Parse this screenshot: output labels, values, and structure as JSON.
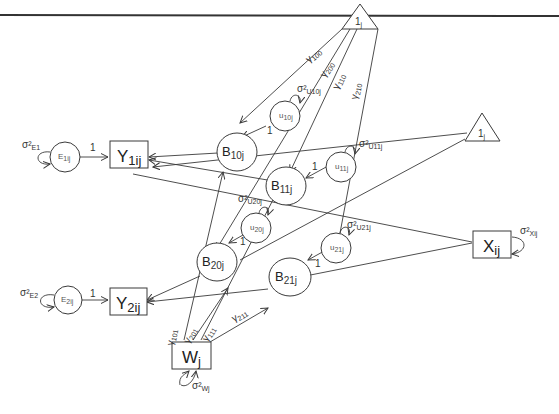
{
  "diagram": {
    "type": "multilevel path diagram",
    "constants": [
      {
        "id": "one_top",
        "label": "1",
        "sub": "j"
      },
      {
        "id": "one_right",
        "label": "1",
        "sub": "j"
      }
    ],
    "observed": [
      {
        "id": "Y1",
        "label": "Y",
        "sub": "1ij"
      },
      {
        "id": "Y2",
        "label": "Y",
        "sub": "2ij"
      },
      {
        "id": "X",
        "label": "X",
        "sub": "ij"
      },
      {
        "id": "W",
        "label": "W",
        "sub": "j"
      }
    ],
    "latent": [
      {
        "id": "B10",
        "label": "B",
        "sub": "10j"
      },
      {
        "id": "B11",
        "label": "B",
        "sub": "11j"
      },
      {
        "id": "B20",
        "label": "B",
        "sub": "20j"
      },
      {
        "id": "B21",
        "label": "B",
        "sub": "21j"
      }
    ],
    "residuals": [
      {
        "id": "E1",
        "label": "E",
        "sub": "1ij",
        "variance": "σ²",
        "variance_sub": "E1"
      },
      {
        "id": "E2",
        "label": "E",
        "sub": "2ij",
        "variance": "σ²",
        "variance_sub": "E2"
      },
      {
        "id": "U10",
        "label": "u",
        "sub": "10j",
        "variance": "σ²",
        "variance_sub": "U10j"
      },
      {
        "id": "U11",
        "label": "u",
        "sub": "11j",
        "variance": "σ²",
        "variance_sub": "U11j"
      },
      {
        "id": "U20",
        "label": "u",
        "sub": "20j",
        "variance": "σ²",
        "variance_sub": "U20j"
      },
      {
        "id": "U21",
        "label": "u",
        "sub": "21j",
        "variance": "σ²",
        "variance_sub": "U21j"
      }
    ],
    "variances": {
      "X": {
        "label": "σ²",
        "sub": "Xij"
      },
      "W": {
        "label": "σ²",
        "sub": "Wj"
      }
    },
    "path_labels": {
      "fixed_one": "1",
      "g100": {
        "label": "γ",
        "sub": "100"
      },
      "g200": {
        "label": "γ",
        "sub": "200"
      },
      "g110": {
        "label": "γ",
        "sub": "110"
      },
      "g210": {
        "label": "γ",
        "sub": "210"
      },
      "g101": {
        "label": "γ",
        "sub": "101"
      },
      "g201": {
        "label": "γ",
        "sub": "201"
      },
      "g111": {
        "label": "γ",
        "sub": "111"
      },
      "g211": {
        "label": "γ",
        "sub": "211"
      }
    },
    "colors": {
      "stroke": "#3a3a3a",
      "text": "#222222",
      "background": "#ffffff"
    }
  }
}
